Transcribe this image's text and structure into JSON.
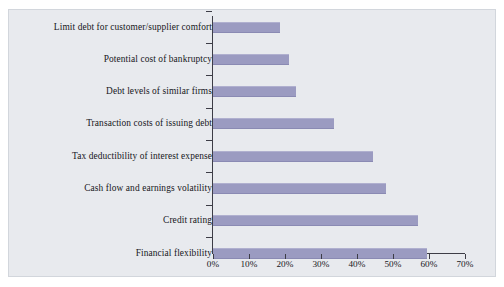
{
  "chart_data": {
    "type": "bar",
    "orientation": "horizontal",
    "title": "",
    "subtitle": "",
    "xlabel": "",
    "ylabel": "",
    "xlim": [
      0,
      70
    ],
    "xunit": "%",
    "grid": false,
    "legend": null,
    "bar_color": "#9b9bc1",
    "plot_background": "#e8eaee",
    "axis_color": "#3d3d46",
    "categories": [
      "Limit debt for customer/supplier comfort",
      "Potential cost of bankruptcy",
      "Debt levels of similar firms",
      "Transaction costs of issuing debt",
      "Tax deductibility of interest expense",
      "Cash flow and earnings volatility",
      "Credit rating",
      "Financial flexibility"
    ],
    "values": [
      18.5,
      21.0,
      23.0,
      33.5,
      44.5,
      48.0,
      57.0,
      59.5
    ],
    "xticks": [
      0,
      10,
      20,
      30,
      40,
      50,
      60,
      70
    ],
    "xtick_labels": [
      "0%",
      "10%",
      "20%",
      "30%",
      "40%",
      "50%",
      "60%",
      "70%"
    ]
  }
}
